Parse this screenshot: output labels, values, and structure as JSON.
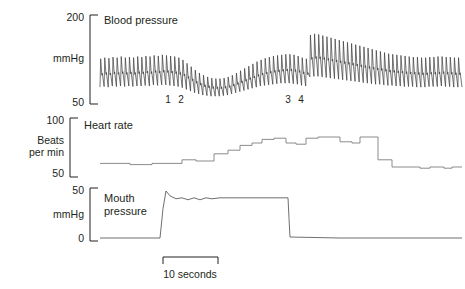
{
  "figure": {
    "title_hidden": "",
    "background": "#ffffff",
    "ink": "#231f20"
  },
  "panels": {
    "blood_pressure": {
      "trace_title": "Blood pressure",
      "unit_label": "mmHg",
      "axis_top": "200",
      "axis_bottom": "50"
    },
    "heart_rate": {
      "trace_title": "Heart rate",
      "unit_label": "Beats\nper min",
      "unit_label_line1": "Beats",
      "unit_label_line2": "per min",
      "axis_top": "100",
      "axis_bottom": "50"
    },
    "mouth_pressure": {
      "trace_title": "Mouth\npressure",
      "trace_title_line1": "Mouth",
      "trace_title_line2": "pressure",
      "unit_label": "mmHg",
      "axis_top": "50",
      "axis_bottom": "0"
    }
  },
  "phase_markers": [
    {
      "label": "1",
      "x_px": 168
    },
    {
      "label": "2",
      "x_px": 181
    },
    {
      "label": "3",
      "x_px": 288
    },
    {
      "label": "4",
      "x_px": 301
    }
  ],
  "scale_bar": {
    "caption": "10 seconds",
    "length_seconds": 10,
    "x_start_px": 163,
    "x_end_px": 218
  },
  "chart_data": {
    "type": "line",
    "xlabel": "",
    "grid": false,
    "legend": "none",
    "x_axis": {
      "unit": "seconds",
      "scale_bar_seconds": 10,
      "scale_bar_pixels": 55,
      "plot_x_start_px": 100,
      "plot_x_end_px": 462
    },
    "annotations": [
      {
        "text": "1",
        "meaning": "phase 1 onset of strain",
        "x_px": 168
      },
      {
        "text": "2",
        "meaning": "phase 2 sustained strain",
        "x_px": 181
      },
      {
        "text": "3",
        "meaning": "phase 3 release",
        "x_px": 288
      },
      {
        "text": "4",
        "meaning": "phase 4 overshoot",
        "x_px": 301
      }
    ],
    "series": [
      {
        "name": "Blood pressure",
        "ylabel": "mmHg",
        "ylim": [
          50,
          200
        ],
        "yticks": [
          50,
          200
        ],
        "panel": "top",
        "description": "Pulsatile arterial pressure, ~35 beats, falling during strain phase 2, recovering then overshooting at phase 4",
        "envelope_systolic": [
          128,
          130,
          129,
          131,
          130,
          132,
          130,
          131,
          130,
          132,
          131,
          133,
          132,
          134,
          133,
          135,
          134,
          133,
          132,
          130,
          126,
          120,
          114,
          108,
          103,
          99,
          96,
          94,
          93,
          93,
          94,
          96,
          99,
          103,
          107,
          111,
          115,
          119,
          123,
          126,
          129,
          131,
          133,
          134,
          135,
          136,
          136,
          135,
          133,
          130,
          128,
          170,
          172,
          171,
          169,
          167,
          165,
          163,
          161,
          159,
          157,
          155,
          153,
          151,
          149,
          147,
          145,
          143,
          141,
          139,
          137,
          136,
          135,
          134,
          133,
          132,
          131,
          131,
          130,
          130,
          131,
          131,
          132,
          132,
          131,
          131,
          130,
          130
        ],
        "envelope_diastolic": [
          78,
          79,
          78,
          80,
          79,
          80,
          79,
          80,
          79,
          80,
          80,
          81,
          80,
          82,
          81,
          82,
          82,
          81,
          80,
          79,
          77,
          74,
          71,
          68,
          66,
          64,
          63,
          62,
          62,
          62,
          63,
          64,
          66,
          68,
          70,
          72,
          74,
          76,
          78,
          80,
          81,
          82,
          83,
          84,
          85,
          85,
          85,
          84,
          83,
          81,
          80,
          96,
          97,
          97,
          96,
          95,
          94,
          93,
          92,
          91,
          90,
          89,
          88,
          87,
          86,
          85,
          84,
          83,
          83,
          82,
          81,
          81,
          80,
          80,
          79,
          79,
          79,
          78,
          78,
          78,
          79,
          79,
          79,
          80,
          79,
          79,
          78,
          78
        ]
      },
      {
        "name": "Heart rate",
        "ylabel": "Beats per min",
        "ylim": [
          50,
          100
        ],
        "yticks": [
          50,
          100
        ],
        "panel": "middle",
        "description": "Step trace, baseline ~63 bpm, rising in steps during strain to ~85 bpm, falling to ~58 bpm after release",
        "step_points": [
          {
            "x_px": 100,
            "value": 63
          },
          {
            "x_px": 130,
            "value": 62
          },
          {
            "x_px": 152,
            "value": 63
          },
          {
            "x_px": 182,
            "value": 66
          },
          {
            "x_px": 196,
            "value": 65
          },
          {
            "x_px": 214,
            "value": 71
          },
          {
            "x_px": 228,
            "value": 74
          },
          {
            "x_px": 240,
            "value": 78
          },
          {
            "x_px": 252,
            "value": 80
          },
          {
            "x_px": 262,
            "value": 83
          },
          {
            "x_px": 274,
            "value": 84
          },
          {
            "x_px": 286,
            "value": 80
          },
          {
            "x_px": 296,
            "value": 79
          },
          {
            "x_px": 306,
            "value": 84
          },
          {
            "x_px": 318,
            "value": 85
          },
          {
            "x_px": 330,
            "value": 85
          },
          {
            "x_px": 340,
            "value": 81
          },
          {
            "x_px": 352,
            "value": 80
          },
          {
            "x_px": 360,
            "value": 85
          },
          {
            "x_px": 374,
            "value": 85
          },
          {
            "x_px": 378,
            "value": 66
          },
          {
            "x_px": 392,
            "value": 60
          },
          {
            "x_px": 420,
            "value": 59
          },
          {
            "x_px": 430,
            "value": 60
          },
          {
            "x_px": 444,
            "value": 59
          },
          {
            "x_px": 452,
            "value": 60
          },
          {
            "x_px": 462,
            "value": 60
          }
        ]
      },
      {
        "name": "Mouth pressure",
        "ylabel": "mmHg",
        "ylim": [
          0,
          50
        ],
        "yticks": [
          0,
          50
        ],
        "panel": "bottom",
        "description": "Flat at 0, sharp rise to ~48 at strain onset, plateau near 40 with small oscillations, abrupt fall to 0 at release",
        "step_points": [
          {
            "x_px": 100,
            "value": 0
          },
          {
            "x_px": 160,
            "value": 0
          },
          {
            "x_px": 163,
            "value": 30
          },
          {
            "x_px": 166,
            "value": 48
          },
          {
            "x_px": 170,
            "value": 43
          },
          {
            "x_px": 176,
            "value": 40
          },
          {
            "x_px": 182,
            "value": 41
          },
          {
            "x_px": 188,
            "value": 39
          },
          {
            "x_px": 194,
            "value": 41
          },
          {
            "x_px": 200,
            "value": 39
          },
          {
            "x_px": 206,
            "value": 41
          },
          {
            "x_px": 212,
            "value": 40
          },
          {
            "x_px": 220,
            "value": 41
          },
          {
            "x_px": 240,
            "value": 41
          },
          {
            "x_px": 270,
            "value": 41
          },
          {
            "x_px": 288,
            "value": 41
          },
          {
            "x_px": 289,
            "value": 20
          },
          {
            "x_px": 290,
            "value": 1
          },
          {
            "x_px": 340,
            "value": 0
          },
          {
            "x_px": 400,
            "value": 0
          },
          {
            "x_px": 462,
            "value": 0
          }
        ]
      }
    ]
  }
}
